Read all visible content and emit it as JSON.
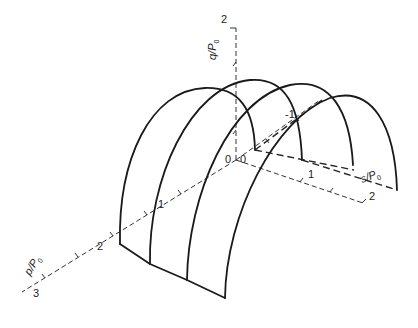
{
  "figure": {
    "axes": {
      "q": {
        "label": "q/P",
        "subscript": "0",
        "ticks": [
          "1",
          "2"
        ]
      },
      "p": {
        "label": "p/P",
        "subscript": "0",
        "ticks": [
          "1",
          "2",
          "3"
        ]
      },
      "s": {
        "label": "s/P",
        "subscript": "0",
        "ticks": [
          "-1",
          "1",
          "2"
        ]
      },
      "origin_labels": [
        "0",
        "0"
      ]
    },
    "arch_count": 4,
    "colors": {
      "curve": "#1a1a1a",
      "axis": "#333333",
      "background": "#ffffff"
    }
  }
}
